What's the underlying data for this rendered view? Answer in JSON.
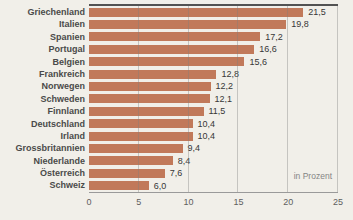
{
  "chart_data": {
    "type": "bar",
    "orientation": "horizontal",
    "title": "",
    "xlabel": "",
    "ylabel": "",
    "unit_note": "in Prozent",
    "xlim": [
      0,
      25
    ],
    "x_ticks": [
      "0",
      "5",
      "10",
      "15",
      "20",
      "25"
    ],
    "grid": "vertical",
    "gridline_positions": [
      5,
      10,
      15,
      20,
      25
    ],
    "categories": [
      "Griechenland",
      "Italien",
      "Spanien",
      "Portugal",
      "Belgien",
      "Frankreich",
      "Norwegen",
      "Schweden",
      "Finnland",
      "Deutschland",
      "Irland",
      "Grossbritannien",
      "Niederlande",
      "Österreich",
      "Schweiz"
    ],
    "values": [
      21.5,
      19.8,
      17.2,
      16.6,
      15.6,
      12.8,
      12.2,
      12.1,
      11.5,
      10.4,
      10.4,
      9.4,
      8.4,
      7.6,
      6.0
    ],
    "value_labels": [
      "21,5",
      "19,8",
      "17,2",
      "16,6",
      "15,6",
      "12,8",
      "12,2",
      "12,1",
      "11,5",
      "10,4",
      "10,4",
      "9,4",
      "8,4",
      "7,6",
      "6,0"
    ],
    "colors": {
      "bar": "#c1795a",
      "background": "#f1efe9",
      "top_border": "#525252",
      "axis_line": "#9a9a9a",
      "label_text": "#4a4a4a",
      "value_text": "#373737",
      "tick_text": "#5e5e5e"
    }
  }
}
